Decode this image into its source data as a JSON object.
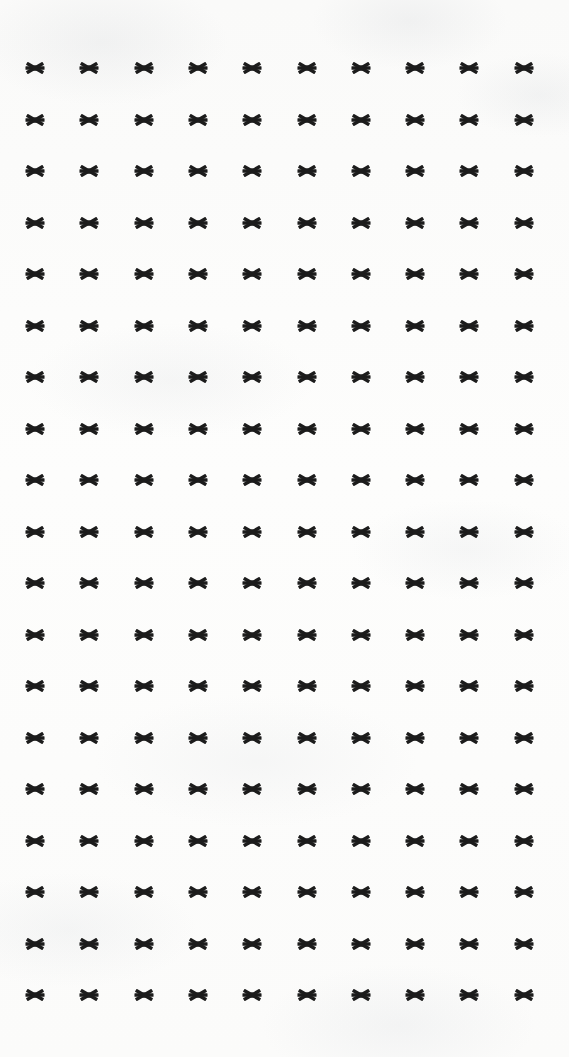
{
  "document": {
    "type": "scanned-page",
    "page_width": 569,
    "page_height": 1057,
    "background_color": "#fdfdfc",
    "ink_color": "#1c1c1c",
    "content_description": "Grid of asterisk characters",
    "glyph": {
      "character": "*",
      "name": "asterisk-glyph",
      "points": 6,
      "size_px": 22
    },
    "grid": {
      "rows": 19,
      "columns": 10,
      "first_column_x": 35,
      "column_spacing": 54.3,
      "first_row_y": 68,
      "row_spacing": 51.5,
      "left_margin": 35,
      "right_margin": 45,
      "top_margin": 68,
      "bottom_margin": 62
    },
    "rows": [
      {
        "index": 1,
        "y": 68,
        "cells": [
          "*",
          "*",
          "*",
          "*",
          "*",
          "*",
          "*",
          "*",
          "*",
          "*"
        ]
      },
      {
        "index": 2,
        "y": 120,
        "cells": [
          "*",
          "*",
          "*",
          "*",
          "*",
          "*",
          "*",
          "*",
          "*",
          "*"
        ]
      },
      {
        "index": 3,
        "y": 171,
        "cells": [
          "*",
          "*",
          "*",
          "*",
          "*",
          "*",
          "*",
          "*",
          "*",
          "*"
        ]
      },
      {
        "index": 4,
        "y": 223,
        "cells": [
          "*",
          "*",
          "*",
          "*",
          "*",
          "*",
          "*",
          "*",
          "*",
          "*"
        ]
      },
      {
        "index": 5,
        "y": 274,
        "cells": [
          "*",
          "*",
          "*",
          "*",
          "*",
          "*",
          "*",
          "*",
          "*",
          "*"
        ]
      },
      {
        "index": 6,
        "y": 326,
        "cells": [
          "*",
          "*",
          "*",
          "*",
          "*",
          "*",
          "*",
          "*",
          "*",
          "*"
        ]
      },
      {
        "index": 7,
        "y": 377,
        "cells": [
          "*",
          "*",
          "*",
          "*",
          "*",
          "*",
          "*",
          "*",
          "*",
          "*"
        ]
      },
      {
        "index": 8,
        "y": 429,
        "cells": [
          "*",
          "*",
          "*",
          "*",
          "*",
          "*",
          "*",
          "*",
          "*",
          "*"
        ]
      },
      {
        "index": 9,
        "y": 480,
        "cells": [
          "*",
          "*",
          "*",
          "*",
          "*",
          "*",
          "*",
          "*",
          "*",
          "*"
        ]
      },
      {
        "index": 10,
        "y": 532,
        "cells": [
          "*",
          "*",
          "*",
          "*",
          "*",
          "*",
          "*",
          "*",
          "*",
          "*"
        ]
      },
      {
        "index": 11,
        "y": 583,
        "cells": [
          "*",
          "*",
          "*",
          "*",
          "*",
          "*",
          "*",
          "*",
          "*",
          "*"
        ]
      },
      {
        "index": 12,
        "y": 635,
        "cells": [
          "*",
          "*",
          "*",
          "*",
          "*",
          "*",
          "*",
          "*",
          "*",
          "*"
        ]
      },
      {
        "index": 13,
        "y": 686,
        "cells": [
          "*",
          "*",
          "*",
          "*",
          "*",
          "*",
          "*",
          "*",
          "*",
          "*"
        ]
      },
      {
        "index": 14,
        "y": 738,
        "cells": [
          "*",
          "*",
          "*",
          "*",
          "*",
          "*",
          "*",
          "*",
          "*",
          "*"
        ]
      },
      {
        "index": 15,
        "y": 789,
        "cells": [
          "*",
          "*",
          "*",
          "*",
          "*",
          "*",
          "*",
          "*",
          "*",
          "*"
        ]
      },
      {
        "index": 16,
        "y": 841,
        "cells": [
          "*",
          "*",
          "*",
          "*",
          "*",
          "*",
          "*",
          "*",
          "*",
          "*"
        ]
      },
      {
        "index": 17,
        "y": 892,
        "cells": [
          "*",
          "*",
          "*",
          "*",
          "*",
          "*",
          "*",
          "*",
          "*",
          "*"
        ]
      },
      {
        "index": 18,
        "y": 944,
        "cells": [
          "*",
          "*",
          "*",
          "*",
          "*",
          "*",
          "*",
          "*",
          "*",
          "*"
        ]
      },
      {
        "index": 19,
        "y": 995,
        "cells": [
          "*",
          "*",
          "*",
          "*",
          "*",
          "*",
          "*",
          "*",
          "*",
          "*"
        ]
      }
    ]
  }
}
